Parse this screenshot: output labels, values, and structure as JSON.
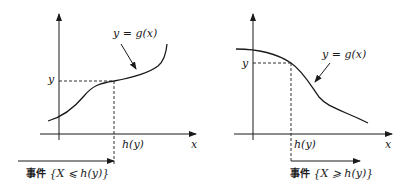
{
  "left_panel": {
    "curve_label": "y = g(x)",
    "y_label": "y",
    "h_label": "h(y)",
    "x_axis_label": "x",
    "event_prefix": "事件",
    "event_expr": "{X ⩽ h(y)}",
    "monotonic": "increasing"
  },
  "right_panel": {
    "curve_label": "y = g(x)",
    "y_label": "y",
    "h_label": "h(y)",
    "x_axis_label": "x",
    "event_prefix": "事件",
    "event_expr": "{X ⩾ h(y)}",
    "monotonic": "decreasing"
  },
  "colors": {
    "stroke": "#1a1a1a",
    "background": "#ffffff"
  }
}
